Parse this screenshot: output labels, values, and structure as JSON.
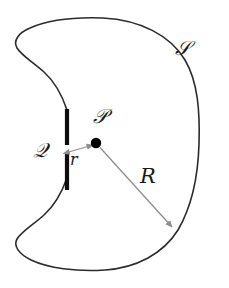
{
  "figure": {
    "type": "geometry-diagram",
    "canvas": {
      "width": 229,
      "height": 288,
      "background": "#ffffff"
    },
    "colors": {
      "outline": "#2b2b2b",
      "slit": "#0d0d0d",
      "point": "#000000",
      "arrow": "#8e8e8e",
      "label": "#1a1a1a"
    },
    "labels": [
      {
        "id": "S",
        "text": "𝒮",
        "role": "surface-label",
        "x": 175,
        "y": 38
      },
      {
        "id": "P",
        "text": "𝒫",
        "role": "point-label",
        "x": 93,
        "y": 106
      },
      {
        "id": "Q",
        "text": "𝒬",
        "role": "point-label",
        "x": 33,
        "y": 140
      },
      {
        "id": "r",
        "text": "r",
        "role": "distance-label",
        "x": 70,
        "y": 152
      },
      {
        "id": "R",
        "text": "R",
        "role": "distance-label",
        "x": 140,
        "y": 166
      }
    ],
    "point_P": {
      "x": 96,
      "y": 143,
      "radius": 5
    },
    "slit": {
      "x": 67,
      "y_top": 108,
      "y_bottom": 190,
      "gap_top": 145,
      "gap_bottom": 152,
      "width": 4
    },
    "arrow_r": {
      "from_x": 94,
      "from_y": 145,
      "to_x": 63,
      "to_y": 154,
      "double_headed": true
    },
    "arrow_R": {
      "from_x": 100,
      "from_y": 147,
      "to_x": 173,
      "to_y": 228,
      "double_headed": false
    }
  }
}
